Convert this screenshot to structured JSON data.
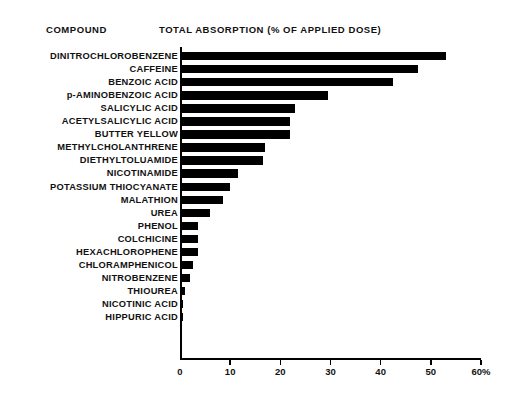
{
  "headers": {
    "compound": "COMPOUND",
    "absorption": "TOTAL ABSORPTION (% OF APPLIED DOSE)"
  },
  "chart_data": {
    "type": "bar",
    "orientation": "horizontal",
    "title": "TOTAL ABSORPTION (% OF APPLIED DOSE)",
    "xlabel": "TOTAL ABSORPTION (% OF APPLIED DOSE)",
    "ylabel": "COMPOUND",
    "xlim": [
      0,
      60
    ],
    "ylim": null,
    "grid": false,
    "legend": null,
    "bar_color": "#000000",
    "background_color": "#ffffff",
    "xticks": [
      0,
      10,
      20,
      30,
      40,
      50,
      60
    ],
    "xticklabels": [
      "0",
      "10",
      "20",
      "30",
      "40",
      "50",
      "60%"
    ],
    "categories": [
      "DINITROCHLOROBENZENE",
      "CAFFEINE",
      "BENZOIC ACID",
      "p-AMINOBENZOIC ACID",
      "SALICYLIC ACID",
      "ACETYLSALICYLIC ACID",
      "BUTTER YELLOW",
      "METHYLCHOLANTHRENE",
      "DIETHYLTOLUAMIDE",
      "NICOTINAMIDE",
      "POTASSIUM THIOCYANATE",
      "MALATHION",
      "UREA",
      "PHENOL",
      "COLCHICINE",
      "HEXACHLOROPHENE",
      "CHLORAMPHENICOL",
      "NITROBENZENE",
      "THIOUREA",
      "NICOTINIC ACID",
      "HIPPURIC ACID"
    ],
    "values": [
      53.0,
      47.5,
      42.5,
      29.5,
      23.0,
      22.0,
      22.0,
      17.0,
      16.5,
      11.5,
      10.0,
      8.5,
      6.0,
      3.5,
      3.5,
      3.5,
      2.5,
      2.0,
      1.0,
      0.5,
      0.5
    ]
  }
}
